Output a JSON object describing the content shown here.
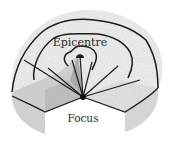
{
  "diagram": {
    "labels": {
      "epicentre": "Epicentre",
      "focus": "Focus"
    },
    "elements": {
      "isoseismal_lines": 3,
      "seismic_rays": 7
    },
    "colors": {
      "top_surface": "#ececec",
      "side_face": "#d9d9d9",
      "cut_face_left": "#bdbdbd",
      "cut_face_right": "#cfcfcf",
      "line": "#1c1c1c"
    }
  }
}
